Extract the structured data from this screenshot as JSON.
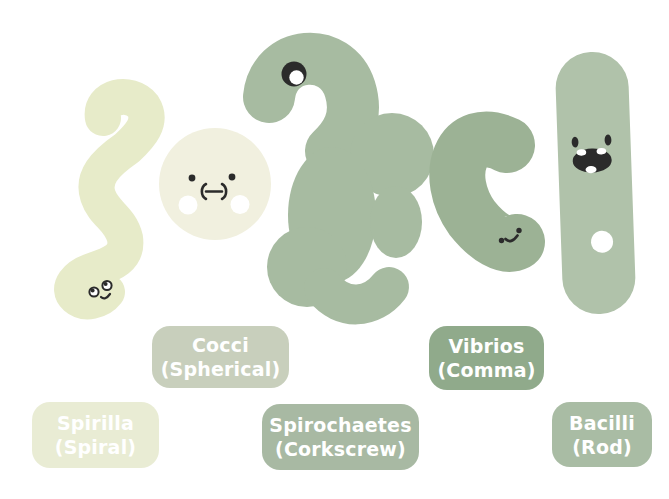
{
  "colors": {
    "background": "#FFFFFF",
    "white": "#FFFFFF",
    "ink": "#2B2B2B",
    "spirilla_body": "#E7EBC9",
    "spirilla_badge": "#E9ECD4",
    "cocci_body": "#F1F0DF",
    "cocci_cheek": "#FFFFFF",
    "cocci_badge": "#C8CFBC",
    "spirochaetes_body": "#A7BBA1",
    "spirochaetes_badge": "#A8B9A3",
    "vibrios_body": "#9CB295",
    "vibrios_badge": "#90AA8B",
    "bacilli_body": "#B0C2AA",
    "bacilli_badge": "#A9BCA4",
    "label_text": "#FFFFFF"
  },
  "labels": {
    "spirilla": {
      "name": "Spirilla",
      "sub": "(Spiral)"
    },
    "cocci": {
      "name": "Cocci",
      "sub": "(Spherical)"
    },
    "spirochaetes": {
      "name": "Spirochaetes",
      "sub": "(Corkscrew)"
    },
    "vibrios": {
      "name": "Vibrios",
      "sub": "(Comma)"
    },
    "bacilli": {
      "name": "Bacilli",
      "sub": "(Rod)"
    }
  }
}
